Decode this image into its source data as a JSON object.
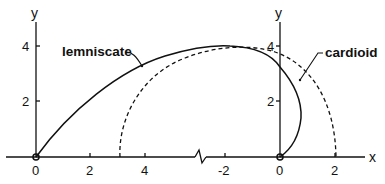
{
  "figure": {
    "left_axis": {
      "y_label": "y",
      "y_ticks": [
        "2",
        "4"
      ],
      "x_ticks": [
        "0",
        "2",
        "4"
      ]
    },
    "right_axis": {
      "y_label": "y",
      "y_ticks": [
        "2",
        "4"
      ],
      "x_ticks": [
        "-2",
        "0",
        "2"
      ],
      "x_label": "x"
    },
    "curves": {
      "lemniscate": "lemniscate",
      "cardioid": "cardioid"
    },
    "colors": {
      "ink": "#111111",
      "background": "#ffffff"
    }
  }
}
